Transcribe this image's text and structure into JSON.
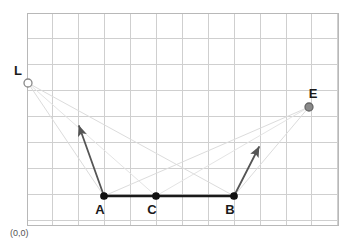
{
  "figure": {
    "type": "geometry-diagram",
    "width": 353,
    "height": 243,
    "background_color": "#ffffff"
  },
  "grid": {
    "visible": true,
    "line_color": "#cfcfcf",
    "border_color": "#b8b8b8",
    "spacing_px": 25.9,
    "left": 27,
    "top": 13,
    "right": 338,
    "bottom": 225,
    "columns": 12,
    "rows": 8
  },
  "origin_label": {
    "text": "(0,0)",
    "x": 10,
    "y": 236,
    "color": "#555555"
  },
  "points": [
    {
      "id": "L",
      "label": "L",
      "x": 28,
      "y": 83,
      "marker": "open-circle",
      "radius": 4,
      "fill": "#ffffff",
      "stroke": "#888888",
      "label_dx": -10,
      "label_dy": -8
    },
    {
      "id": "E",
      "label": "E",
      "x": 309,
      "y": 107,
      "marker": "filled-circle",
      "radius": 4,
      "fill": "#8a8a8a",
      "stroke": "#666666",
      "label_dx": 4,
      "label_dy": -9
    },
    {
      "id": "A",
      "label": "A",
      "x": 104,
      "y": 196,
      "marker": "filled-dot",
      "radius": 3.2,
      "fill": "#111111",
      "stroke": "#111111",
      "label_dx": -4,
      "label_dy": 18
    },
    {
      "id": "C",
      "label": "C",
      "x": 156,
      "y": 196,
      "marker": "filled-dot",
      "radius": 3.2,
      "fill": "#111111",
      "stroke": "#111111",
      "label_dx": -4,
      "label_dy": 18
    },
    {
      "id": "B",
      "label": "B",
      "x": 234,
      "y": 196,
      "marker": "filled-dot",
      "radius": 3.2,
      "fill": "#111111",
      "stroke": "#111111",
      "label_dx": -4,
      "label_dy": 18
    }
  ],
  "mirror_segment": {
    "name": "mirror-surface",
    "from": "A",
    "to": "B",
    "x1": 104,
    "y1": 196,
    "x2": 234,
    "y2": 196,
    "color": "#1a1a1a",
    "width": 2.6
  },
  "normals": [
    {
      "id": "normal-at-A",
      "from_x": 104,
      "from_y": 196,
      "to_x": 79,
      "to_y": 126,
      "color": "#555555",
      "width": 1.8,
      "arrow": true
    },
    {
      "id": "normal-at-B",
      "from_x": 234,
      "from_y": 196,
      "to_x": 259,
      "to_y": 147,
      "color": "#555555",
      "width": 1.8,
      "arrow": true
    }
  ],
  "rays": [
    {
      "id": "ray-L-to-A",
      "from_x": 28,
      "from_y": 83,
      "to_x": 104,
      "to_y": 196,
      "color": "#dcdcdc",
      "width": 1.0
    },
    {
      "id": "ray-A-to-E",
      "from_x": 104,
      "from_y": 196,
      "to_x": 309,
      "to_y": 107,
      "color": "#dcdcdc",
      "width": 1.0
    },
    {
      "id": "ray-L-to-B",
      "from_x": 28,
      "from_y": 83,
      "to_x": 234,
      "to_y": 196,
      "color": "#dcdcdc",
      "width": 1.0
    },
    {
      "id": "ray-B-to-E",
      "from_x": 234,
      "from_y": 196,
      "to_x": 309,
      "to_y": 107,
      "color": "#dcdcdc",
      "width": 1.0
    },
    {
      "id": "ray-L-to-C",
      "from_x": 28,
      "from_y": 83,
      "to_x": 156,
      "to_y": 196,
      "color": "#e4e4e4",
      "width": 1.0
    },
    {
      "id": "ray-C-to-E",
      "from_x": 156,
      "from_y": 196,
      "to_x": 309,
      "to_y": 107,
      "color": "#e4e4e4",
      "width": 1.0
    }
  ],
  "chart_data": {
    "type": "scatter",
    "title": "",
    "xlabel": "",
    "ylabel": "",
    "grid": true,
    "legend": "none",
    "xlim": [
      0,
      12
    ],
    "ylim": [
      0,
      8
    ],
    "annotations": [
      "(0,0)"
    ],
    "points": [
      {
        "label": "L",
        "x": 0.04,
        "y": 5.48
      },
      {
        "label": "E",
        "x": 10.88,
        "y": 4.56
      },
      {
        "label": "A",
        "x": 2.97,
        "y": 1.12
      },
      {
        "label": "C",
        "x": 4.98,
        "y": 1.12
      },
      {
        "label": "B",
        "x": 7.99,
        "y": 1.12
      }
    ],
    "segments": [
      {
        "name": "mirror AB",
        "from": "A",
        "to": "B",
        "style": "thick-solid-black"
      },
      {
        "name": "normal at A",
        "from": "A",
        "to": "arrow-tip",
        "style": "arrow-gray"
      },
      {
        "name": "normal at B",
        "from": "B",
        "to": "arrow-tip",
        "style": "arrow-gray"
      },
      {
        "name": "incident L→A",
        "from": "L",
        "to": "A",
        "style": "faint"
      },
      {
        "name": "reflected A→E",
        "from": "A",
        "to": "E",
        "style": "faint"
      },
      {
        "name": "incident L→B",
        "from": "L",
        "to": "B",
        "style": "faint"
      },
      {
        "name": "reflected B→E",
        "from": "B",
        "to": "E",
        "style": "faint"
      },
      {
        "name": "incident L→C",
        "from": "L",
        "to": "C",
        "style": "faint"
      },
      {
        "name": "reflected C→E",
        "from": "C",
        "to": "E",
        "style": "faint"
      }
    ]
  }
}
